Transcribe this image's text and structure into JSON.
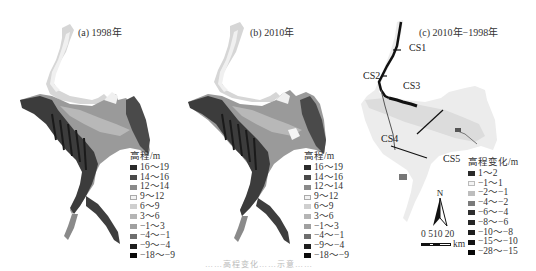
{
  "panels": [
    {
      "id": "a",
      "title": "(a) 1998年",
      "legend": {
        "title": "高程/m",
        "items": [
          {
            "label": "16～19",
            "color": "#2b2b2b"
          },
          {
            "label": "14～16",
            "color": "#4a4a4a"
          },
          {
            "label": "12～14",
            "color": "#8a8a8a"
          },
          {
            "label": "9～12",
            "color": "#f2f2f2"
          },
          {
            "label": "6～9",
            "color": "#cfcfcf"
          },
          {
            "label": "3～6",
            "color": "#b5b5b5"
          },
          {
            "label": "−1～3",
            "color": "#a0a0a0"
          },
          {
            "label": "−4～−1",
            "color": "#6e6e6e"
          },
          {
            "label": "−9～−4",
            "color": "#1e1e1e"
          },
          {
            "label": "−18～−9",
            "color": "#0a0a0a"
          }
        ]
      }
    },
    {
      "id": "b",
      "title": "(b) 2010年",
      "legend": {
        "title": "高程/m",
        "items": [
          {
            "label": "16～19",
            "color": "#2b2b2b"
          },
          {
            "label": "14～16",
            "color": "#4a4a4a"
          },
          {
            "label": "12～14",
            "color": "#8a8a8a"
          },
          {
            "label": "9～12",
            "color": "#f2f2f2"
          },
          {
            "label": "6～9",
            "color": "#cfcfcf"
          },
          {
            "label": "3～6",
            "color": "#b5b5b5"
          },
          {
            "label": "−1～3",
            "color": "#a0a0a0"
          },
          {
            "label": "−4～−1",
            "color": "#6e6e6e"
          },
          {
            "label": "−9～−4",
            "color": "#1e1e1e"
          },
          {
            "label": "−18～−9",
            "color": "#0a0a0a"
          }
        ]
      }
    },
    {
      "id": "c",
      "title": "(c) 2010年−1998年",
      "cross_sections": [
        "CS1",
        "CS2",
        "CS3",
        "CS4",
        "CS5"
      ],
      "legend": {
        "title": "高程变化/m",
        "items": [
          {
            "label": "1～2",
            "color": "#2a2a2a"
          },
          {
            "label": "−1～1",
            "color": "#f4f4f4"
          },
          {
            "label": "−2～−1",
            "color": "#bdbdbd"
          },
          {
            "label": "−4～−2",
            "color": "#7a7a7a"
          },
          {
            "label": "−6～−4",
            "color": "#2e2e2e"
          },
          {
            "label": "−8～−6",
            "color": "#262626"
          },
          {
            "label": "−10～−8",
            "color": "#1e1e1e"
          },
          {
            "label": "−15～−10",
            "color": "#141414"
          },
          {
            "label": "−28～−15",
            "color": "#080808"
          }
        ]
      },
      "north_arrow": {
        "label": "N"
      },
      "scale_bar": {
        "ticks": "0 510 20",
        "unit": "km"
      }
    }
  ],
  "caption_partial": "……高程变化……示意……"
}
